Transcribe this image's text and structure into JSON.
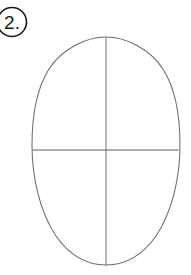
{
  "page": {
    "background_color": "#ffffff",
    "width": 191,
    "height": 275
  },
  "step_marker": {
    "label": "2.",
    "shape": "circle",
    "clipped_at_left_edge": true,
    "circle": {
      "cx": 12,
      "cy": 22,
      "r": 14.5,
      "stroke_color": "#1a1a1a",
      "stroke_width": 1.6,
      "fill": "none"
    },
    "text": {
      "x": 12,
      "y": 29,
      "color": "#1a1a1a",
      "font_size": 19
    }
  },
  "drawing": {
    "description": "Vertical oval head shape with vertical centerline and horizontal eye line",
    "stroke_color": "#6b6b6b",
    "stroke_width": 1,
    "head_oval": {
      "name": "head-oval",
      "cx": 106,
      "cy": 151,
      "rx": 74,
      "ry": 114,
      "top_y": 37,
      "bottom_y": 265,
      "left_x": 32,
      "right_x": 180,
      "stroke_color": "#6b6b6b",
      "stroke_width": 1.05,
      "fill": "none"
    },
    "vertical_center_line": {
      "name": "vertical-center-line",
      "x": 106,
      "y1": 38,
      "y2": 265,
      "stroke_color": "#707070",
      "stroke_width": 1
    },
    "horizontal_eye_line": {
      "name": "horizontal-eye-line",
      "y": 150,
      "x1": 33,
      "x2": 178,
      "stroke_color": "#5e5e5e",
      "stroke_width": 1.1
    }
  }
}
